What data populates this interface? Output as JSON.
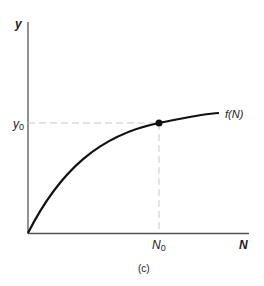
{
  "figure": {
    "caption": "(c)",
    "axes": {
      "y_label": "y",
      "x_label": "N"
    },
    "markers": {
      "y0_label": "y",
      "y0_sub": "0",
      "n0_label": "N",
      "n0_sub": "0"
    },
    "curve_label": "f(N)",
    "colors": {
      "axis": "#555555",
      "curve": "#111111",
      "dashed": "#c8c8c8"
    }
  }
}
